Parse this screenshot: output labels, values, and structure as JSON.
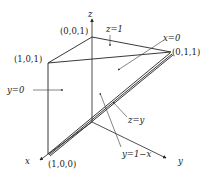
{
  "diagram": {
    "type": "3d-region",
    "axes": {
      "x_label": "x",
      "y_label": "y",
      "z_label": "z"
    },
    "vertices": {
      "v001": "(0,0,1)",
      "v101": "(1,0,1)",
      "v011": "(0,1,1)",
      "v100": "(1,0,0)"
    },
    "planes": {
      "z1": "z=1",
      "x0": "x=0",
      "y0": "y=0",
      "zy": "z=y",
      "y1mx": "y=1−x"
    },
    "colors": {
      "ink": "#222222",
      "background": "#ffffff"
    }
  }
}
